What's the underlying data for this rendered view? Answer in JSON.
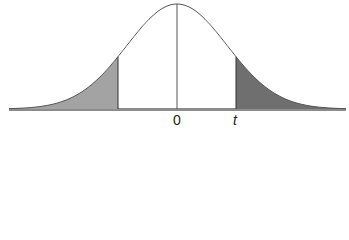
{
  "figure": {
    "labels": {
      "center": "0",
      "critical": "t"
    },
    "colors": {
      "curve": "#555555",
      "left_tail_fill": "#a3a3a3",
      "right_tail_fill": "#6f6f6f",
      "baseline": "#8c8c8c",
      "background": "#ffffff"
    }
  },
  "chart_data": {
    "type": "area",
    "title": "",
    "xlabel": "",
    "ylabel": "",
    "distribution": "symmetric bell curve (t-distribution)",
    "x_tick_labels": [
      "0",
      "t"
    ],
    "shaded_regions": [
      {
        "name": "left tail",
        "range": [
          "-inf",
          "-t"
        ],
        "shade": "light gray"
      },
      {
        "name": "right tail",
        "range": [
          "t",
          "inf"
        ],
        "shade": "dark gray"
      }
    ],
    "center_line": 0,
    "grid": false,
    "legend": "none"
  }
}
